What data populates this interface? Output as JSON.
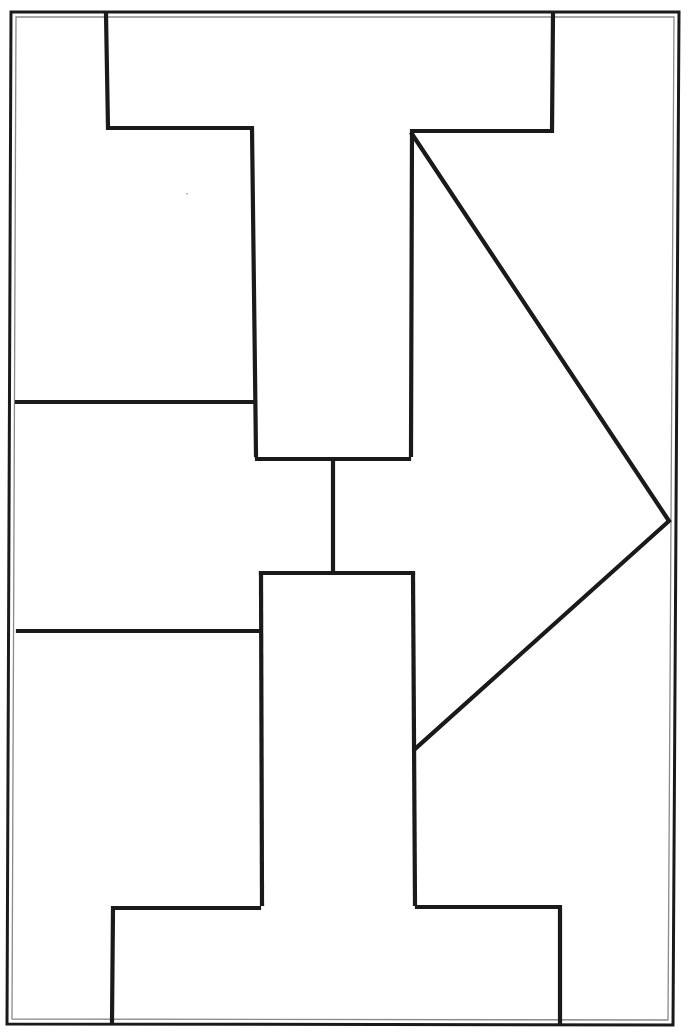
{
  "diagram": {
    "type": "graphic-organizer",
    "colors": {
      "background": "#ffffff",
      "stroke": "#1a1a1a",
      "inner_border": "#8a8a8a"
    },
    "stroke_width": 4,
    "border": {
      "outer": [
        [
          11,
          12
        ],
        [
          679,
          12
        ],
        [
          673,
          1025
        ],
        [
          7,
          1024
        ]
      ],
      "inner": [
        [
          16,
          17
        ],
        [
          674,
          17
        ],
        [
          668,
          1020
        ],
        [
          12,
          1019
        ]
      ]
    },
    "top_t_shape": [
      [
        106,
        14
      ],
      [
        108,
        128
      ],
      [
        252,
        128
      ],
      [
        256,
        455
      ]
    ],
    "top_t_shape_right": [
      [
        553,
        14
      ],
      [
        552,
        131
      ],
      [
        412,
        131
      ],
      [
        411,
        455
      ]
    ],
    "upper_box_bottom": [
      [
        257,
        459
      ],
      [
        409,
        459
      ]
    ],
    "connector": [
      [
        333,
        461
      ],
      [
        333,
        572
      ]
    ],
    "lower_box_top": [
      [
        261,
        573
      ],
      [
        413,
        573
      ]
    ],
    "lower_t_shape_left": [
      [
        261,
        573
      ],
      [
        262,
        904
      ],
      [
        113,
        908
      ],
      [
        112,
        1022
      ]
    ],
    "lower_t_shape_right": [
      [
        413,
        573
      ],
      [
        415,
        904
      ],
      [
        560,
        907
      ],
      [
        560,
        1022
      ]
    ],
    "left_divider_upper": [
      [
        17,
        402
      ],
      [
        254,
        402
      ]
    ],
    "left_divider_lower": [
      [
        18,
        631
      ],
      [
        259,
        631
      ]
    ],
    "arrow": [
      [
        412,
        134
      ],
      [
        669,
        521
      ],
      [
        415,
        749
      ]
    ],
    "text_fields": []
  }
}
